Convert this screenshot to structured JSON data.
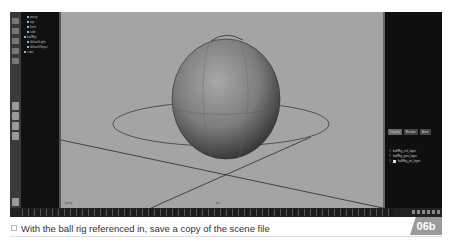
{
  "app": {
    "outliner": {
      "items": [
        {
          "label": "persp"
        },
        {
          "label": "top"
        },
        {
          "label": "front"
        },
        {
          "label": "side"
        },
        {
          "label": "ballRig"
        },
        {
          "label": "defaultLight"
        },
        {
          "label": "defaultObject"
        },
        {
          "label": "cube"
        }
      ]
    },
    "viewport": {
      "camera_label": "persp",
      "frame_label": "fps"
    },
    "channel_box": {
      "tabs": [
        "Display",
        "Render",
        "Anim"
      ],
      "layers": [
        {
          "label": "ballRig_ctrl_layer"
        },
        {
          "label": "ballRig_geo_layer"
        },
        {
          "label": "ballRig_jnt_layer"
        }
      ]
    },
    "timeline": {
      "start": "1",
      "end": "24"
    }
  },
  "caption": {
    "text": "With the ball rig referenced in, save a copy of the scene file",
    "badge": "06b",
    "badge_color": "#9a9a9a"
  }
}
